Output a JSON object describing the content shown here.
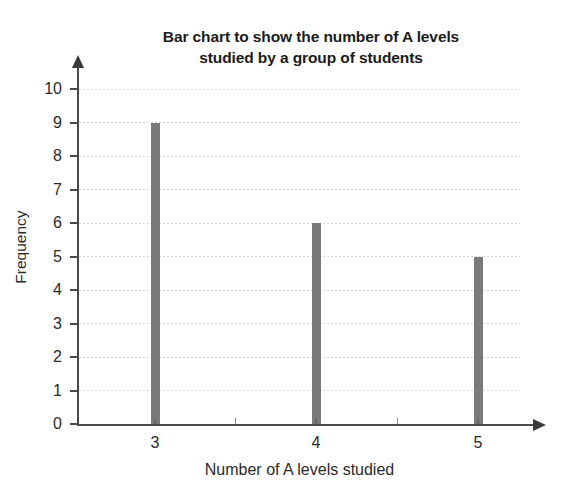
{
  "chart_data": {
    "type": "bar",
    "title": "Bar chart to show the number of A levels studied by a group of students",
    "title_lines": [
      "Bar chart to show the number of A levels",
      "studied by a group of students"
    ],
    "categories": [
      "3",
      "4",
      "5"
    ],
    "values": [
      9,
      6,
      5
    ],
    "xlabel": "Number of A levels studied",
    "ylabel": "Frequency",
    "ylim": [
      0,
      10
    ],
    "ytick_labels": [
      "0",
      "1",
      "2",
      "3",
      "4",
      "5",
      "6",
      "7",
      "8",
      "9",
      "10"
    ],
    "ytick_values": [
      0,
      1,
      2,
      3,
      4,
      5,
      6,
      7,
      8,
      9,
      10
    ],
    "grid": true,
    "legend": false,
    "bar_color": "#7a7a7a",
    "axis_color": "#4a4a4a",
    "grid_color": "#d2d2d4",
    "minor_xticks": [
      "",
      ""
    ]
  }
}
